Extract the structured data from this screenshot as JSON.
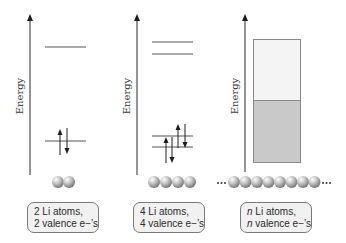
{
  "diagram": {
    "axis_label": "Energy",
    "colors": {
      "axis": "#2b2b2b",
      "level_line": "#555555",
      "band_border": "#8a8a8a",
      "empty_band": "#f4f4f4",
      "filled_band": "#c9c9c9",
      "atom": "#a8a8a8",
      "label_bg": "#f1f1f1"
    },
    "panels": [
      {
        "id": "two-atoms",
        "axis_label": "Energy",
        "atom_count_shown": 2,
        "levels": [
          {
            "position": "upper",
            "electrons": 0
          },
          {
            "position": "lower",
            "electrons": 2
          }
        ],
        "label_line1_prefix": "2",
        "label_line1_rest": " Li atoms,",
        "label_line2_prefix": "2",
        "label_line2_rest": " valence e−’s"
      },
      {
        "id": "four-atoms",
        "axis_label": "Energy",
        "atom_count_shown": 4,
        "levels": [
          {
            "position": "upper-1",
            "electrons": 0
          },
          {
            "position": "upper-2",
            "electrons": 0
          },
          {
            "position": "lower-1",
            "electrons": 2
          },
          {
            "position": "lower-2",
            "electrons": 2
          }
        ],
        "label_line1_prefix": "4",
        "label_line1_rest": " Li atoms,",
        "label_line2_prefix": "4",
        "label_line2_rest": " valence e−’s"
      },
      {
        "id": "n-atoms",
        "axis_label": "Energy",
        "atom_count_shown": 8,
        "ellipsis": "···",
        "bands": [
          {
            "name": "empty-band",
            "fill": "empty"
          },
          {
            "name": "filled-band",
            "fill": "filled"
          }
        ],
        "label_line1_prefix": "n",
        "label_line1_rest": " Li atoms,",
        "label_line2_prefix": "n",
        "label_line2_rest": " valence e−’s"
      }
    ]
  }
}
